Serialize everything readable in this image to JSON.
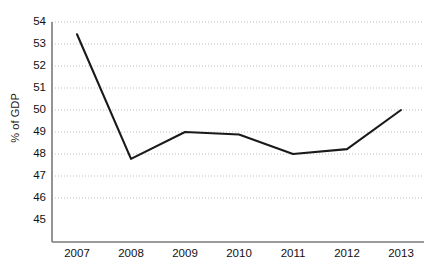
{
  "chart_data": {
    "type": "line",
    "title": "",
    "xlabel": "",
    "ylabel": "% of GDP",
    "categories": [
      "2007",
      "2008",
      "2009",
      "2010",
      "2011",
      "2012",
      "2013"
    ],
    "values": [
      53.5,
      48.4,
      49.5,
      49.4,
      48.6,
      48.8,
      50.4
    ],
    "series": [
      {
        "name": "% of GDP",
        "values": [
          53.5,
          48.4,
          49.5,
          49.4,
          48.6,
          48.8,
          50.4
        ]
      }
    ],
    "ylim": [
      45,
      54
    ],
    "y_ticks": [
      45,
      46,
      47,
      48,
      49,
      50,
      51,
      52,
      53,
      54
    ],
    "x_ticks": [
      "2007",
      "2008",
      "2009",
      "2010",
      "2011",
      "2012",
      "2013"
    ],
    "grid": "horizontal-dotted",
    "legend": "none",
    "line_color": "#1a1a1a",
    "grid_color": "#c8c8c8",
    "axis_color": "#808080",
    "background": "#ffffff"
  },
  "axes": {
    "y_title": "% of GDP",
    "y_tick_labels": [
      "54",
      "53",
      "52",
      "51",
      "50",
      "49",
      "48",
      "47",
      "46",
      "45"
    ],
    "x_tick_labels": [
      "2007",
      "2008",
      "2009",
      "2010",
      "2011",
      "2012",
      "2013"
    ]
  }
}
